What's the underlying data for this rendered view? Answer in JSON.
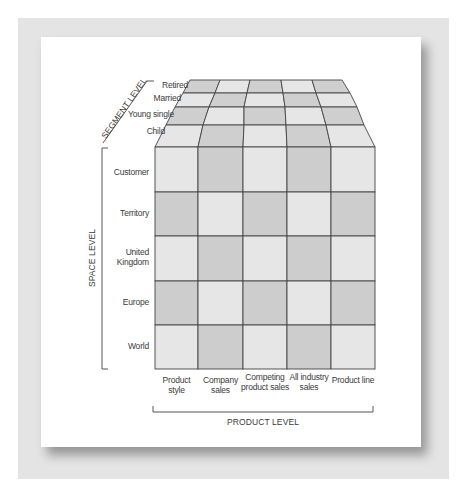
{
  "figure": {
    "axes": {
      "segment": {
        "title": "SEGMENT LEVEL",
        "items": [
          "Retired",
          "Married",
          "Young single",
          "Child"
        ]
      },
      "space": {
        "title": "SPACE LEVEL",
        "items": [
          "Customer",
          "Territory",
          "United Kingdom",
          "Europe",
          "World"
        ]
      },
      "product": {
        "title": "PRODUCT LEVEL",
        "items": [
          "Product style",
          "Company sales",
          "Competing product sales",
          "All industry sales",
          "Product line"
        ]
      }
    },
    "colors": {
      "cell_light": "#e6e6e6",
      "cell_dark": "#cdcdcd",
      "grid_line": "#444444",
      "frame": "#e4e4e4"
    }
  }
}
